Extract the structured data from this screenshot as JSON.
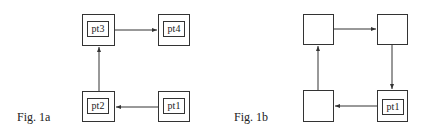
{
  "figures": [
    {
      "caption": "Fig. 1a",
      "nodes": [
        {
          "id": "top-left",
          "label": "pt3"
        },
        {
          "id": "top-right",
          "label": "pt4"
        },
        {
          "id": "bottom-left",
          "label": "pt2"
        },
        {
          "id": "bottom-right",
          "label": "pt1"
        }
      ],
      "edges": [
        {
          "from": "bottom-right",
          "to": "bottom-left"
        },
        {
          "from": "bottom-left",
          "to": "top-left"
        },
        {
          "from": "top-left",
          "to": "top-right"
        }
      ]
    },
    {
      "caption": "Fig. 1b",
      "nodes": [
        {
          "id": "top-left",
          "label": ""
        },
        {
          "id": "top-right",
          "label": ""
        },
        {
          "id": "bottom-left",
          "label": ""
        },
        {
          "id": "bottom-right",
          "label": "pt1"
        }
      ],
      "edges": [
        {
          "from": "top-left",
          "to": "top-right"
        },
        {
          "from": "top-right",
          "to": "bottom-right"
        },
        {
          "from": "bottom-right",
          "to": "bottom-left"
        },
        {
          "from": "bottom-left",
          "to": "top-left"
        }
      ]
    }
  ]
}
